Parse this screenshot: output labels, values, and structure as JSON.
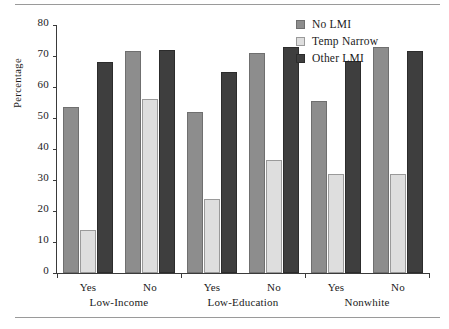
{
  "chart_data": {
    "type": "bar",
    "title": "",
    "xlabel": "",
    "ylabel": "Percentage",
    "ylim": [
      0,
      80
    ],
    "ytick_step": 10,
    "yticks": [
      0,
      10,
      20,
      30,
      40,
      50,
      60,
      70,
      80
    ],
    "grid": false,
    "legend_position": "top-right",
    "categories": [
      "Yes",
      "No",
      "Yes",
      "No",
      "Yes",
      "No"
    ],
    "group_labels": [
      "Low-Income",
      "Low-Education",
      "Nonwhite"
    ],
    "series": [
      {
        "name": "No LMI",
        "color": "#8d8d8d",
        "values": [
          53.5,
          71.5,
          52.0,
          71.0,
          55.5,
          73.0
        ]
      },
      {
        "name": "Temp Narrow",
        "color": "#dedede",
        "values": [
          14.0,
          56.0,
          24.0,
          36.5,
          32.0,
          32.0
        ]
      },
      {
        "name": "Other LMI",
        "color": "#3e3e3e",
        "values": [
          68.0,
          72.0,
          65.0,
          73.0,
          68.5,
          71.5
        ]
      }
    ]
  },
  "colors": {
    "no_lmi": "#8d8d8d",
    "temp_narrow": "#dedede",
    "other_lmi": "#3e3e3e",
    "axis": "#3a3a3a",
    "rule": "#9a9a9a"
  }
}
